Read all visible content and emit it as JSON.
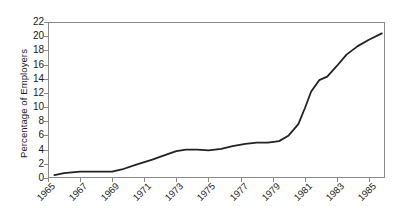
{
  "chart_data": {
    "type": "line",
    "title": "",
    "xlabel": "",
    "ylabel": "Percentage of Employers",
    "xlim": [
      1965,
      1986
    ],
    "ylim": [
      0,
      22
    ],
    "grid": false,
    "legend": null,
    "y_ticks": [
      22,
      20,
      18,
      16,
      14,
      12,
      10,
      8,
      6,
      4,
      2,
      0
    ],
    "x_ticks": [
      1965,
      1967,
      1969,
      1971,
      1973,
      1975,
      1977,
      1979,
      1981,
      1983,
      1985
    ],
    "x_tick_labels": [
      "1965",
      "1967",
      "1969",
      "1971",
      "1973",
      "1975",
      "1977",
      "1979",
      "1981",
      "1983",
      "1985"
    ],
    "line_color": "#222222",
    "line_width": 1.8,
    "series": [
      {
        "name": "Percentage of Employers",
        "x": [
          1965.4,
          1966.0,
          1967.0,
          1968.0,
          1969.0,
          1969.6,
          1970.5,
          1971.5,
          1972.5,
          1973.0,
          1973.6,
          1974.3,
          1975.0,
          1975.8,
          1976.5,
          1977.3,
          1978.0,
          1978.7,
          1979.4,
          1980.0,
          1980.6,
          1981.0,
          1981.4,
          1981.9,
          1982.4,
          1983.0,
          1983.6,
          1984.3,
          1985.0,
          1985.8
        ],
        "values": [
          0.4,
          0.7,
          0.9,
          0.9,
          0.9,
          1.2,
          1.9,
          2.6,
          3.4,
          3.8,
          4.0,
          4.0,
          3.9,
          4.1,
          4.5,
          4.8,
          5.0,
          5.0,
          5.2,
          6.0,
          7.6,
          9.8,
          12.2,
          13.8,
          14.3,
          15.8,
          17.4,
          18.6,
          19.5,
          20.4
        ]
      }
    ]
  }
}
